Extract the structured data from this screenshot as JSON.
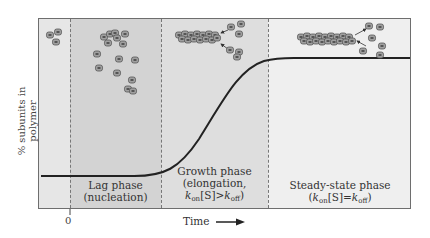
{
  "figure": {
    "y_axis_label": "% subunits in polymer",
    "x_axis_label": "Time",
    "x_tick_zero": "0",
    "phases": [
      {
        "id": "lag",
        "line1": "Lag phase",
        "line2": "(nucleation)"
      },
      {
        "id": "growth",
        "line1": "Growth phase",
        "line2": "(elongation,",
        "line3_k": "k",
        "line3_on": "on",
        "line3_mid": "[S]>",
        "line3_k2": "k",
        "line3_off": "off",
        "line3_end": ")"
      },
      {
        "id": "steady",
        "line1": "Steady-state phase",
        "line2_open": "(",
        "line2_k": "k",
        "line2_on": "on",
        "line2_mid": "[S]=",
        "line2_k2": "k",
        "line2_off": "off",
        "line2_close": ")"
      }
    ],
    "colors": {
      "lag": "#d3d3d3",
      "growth": "#dedede",
      "steady": "#efefef",
      "curve": "#222222",
      "subunit": "#9a9a9a"
    }
  }
}
